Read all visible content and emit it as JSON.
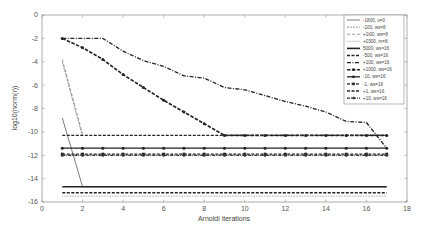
{
  "chart_data": {
    "type": "line",
    "title": "",
    "xlabel": "Arnoldi iterations",
    "ylabel": "log10(norm(r))",
    "xlim": [
      0,
      18
    ],
    "ylim": [
      -16,
      0
    ],
    "xticks": [
      0,
      2,
      4,
      6,
      8,
      10,
      12,
      14,
      16,
      18
    ],
    "yticks": [
      0,
      -2,
      -4,
      -6,
      -8,
      -10,
      -12,
      -14,
      -16
    ],
    "grid": false,
    "legend_position": "top-right",
    "series": [
      {
        "name": "-1800, u=0",
        "style": "solid-thin",
        "x": [
          1,
          2,
          17
        ],
        "y": [
          -8.8,
          -14.7,
          -14.7
        ]
      },
      {
        "name": "-100, ws=8",
        "style": "dashed-thin",
        "x": [
          1,
          2
        ],
        "y": [
          -4.0,
          -10.4
        ]
      },
      {
        "name": "+1i00, ws=8",
        "style": "dash-gap",
        "x": [
          1,
          2
        ],
        "y": [
          -3.8,
          -10.2
        ]
      },
      {
        "name": "+0300, m=8",
        "style": "dotted",
        "x": [
          1,
          17
        ],
        "y": [
          -15.5,
          -15.5
        ]
      },
      {
        "name": "5000, ws=16",
        "style": "solid-thick",
        "x": [
          1,
          17
        ],
        "y": [
          -14.7,
          -14.7
        ]
      },
      {
        "name": "-500, ws=16",
        "style": "dashed-thick",
        "x": [
          1,
          17
        ],
        "y": [
          -15.2,
          -15.2
        ]
      },
      {
        "name": "+100, ws=16",
        "style": "dash-dot",
        "x": [
          1,
          2,
          3,
          4,
          5,
          6,
          7,
          8,
          9,
          10,
          11,
          12,
          13,
          14,
          15,
          16,
          17
        ],
        "y": [
          -2.0,
          -2.0,
          -2.0,
          -3.1,
          -3.9,
          -4.4,
          -5.2,
          -5.4,
          -6.2,
          -6.4,
          -6.9,
          -7.4,
          -7.8,
          -8.3,
          -9.1,
          -9.2,
          -11.4
        ]
      },
      {
        "name": "+1000, ws=16",
        "style": "dashed-marker",
        "x": [
          1,
          2,
          3,
          4,
          5,
          6,
          7,
          8,
          9,
          10,
          11,
          12,
          13,
          14,
          15,
          16,
          17
        ],
        "y": [
          -2.0,
          -2.8,
          -3.8,
          -5.1,
          -6.2,
          -7.3,
          -8.3,
          -9.3,
          -10.3,
          -10.3,
          -10.3,
          -10.3,
          -10.3,
          -10.3,
          -10.3,
          -10.3,
          -10.3
        ]
      },
      {
        "name": "-10, ws=16",
        "style": "solid-dot",
        "x": [
          1,
          2,
          3,
          4,
          5,
          6,
          7,
          8,
          9,
          10,
          11,
          12,
          13,
          14,
          15,
          16,
          17
        ],
        "y": [
          -11.4,
          -11.4,
          -11.4,
          -11.4,
          -11.4,
          -11.4,
          -11.4,
          -11.4,
          -11.4,
          -11.4,
          -11.4,
          -11.4,
          -11.4,
          -11.4,
          -11.4,
          -11.4,
          -11.4
        ]
      },
      {
        "name": "-1, ws=16",
        "style": "dashed-square",
        "x": [
          1,
          2,
          3,
          4,
          5,
          6,
          7,
          8,
          9,
          10,
          11,
          12,
          13,
          14,
          15,
          16,
          17
        ],
        "y": [
          -11.9,
          -11.9,
          -11.9,
          -11.9,
          -11.9,
          -11.9,
          -11.9,
          -11.9,
          -11.9,
          -11.9,
          -11.9,
          -11.9,
          -11.9,
          -11.9,
          -11.9,
          -11.9,
          -11.9
        ]
      },
      {
        "name": "+1, ws=16",
        "style": "dashed-thick-2",
        "x": [
          1,
          17
        ],
        "y": [
          -10.3,
          -10.3
        ]
      },
      {
        "name": "+10, ws=16",
        "style": "dashdot-dot",
        "x": [
          1,
          2,
          3,
          4,
          5,
          6,
          7,
          8,
          9,
          10,
          11,
          12,
          13,
          14,
          15,
          16,
          17
        ],
        "y": [
          -12.0,
          -12.0,
          -12.0,
          -12.0,
          -12.0,
          -12.0,
          -12.0,
          -12.0,
          -12.0,
          -12.0,
          -12.0,
          -12.0,
          -12.0,
          -12.0,
          -12.0,
          -12.0,
          -12.0
        ]
      }
    ]
  },
  "colors": {
    "line": "#1a1a1a",
    "axis": "#888888",
    "text": "#555555",
    "background": "#ffffff"
  }
}
